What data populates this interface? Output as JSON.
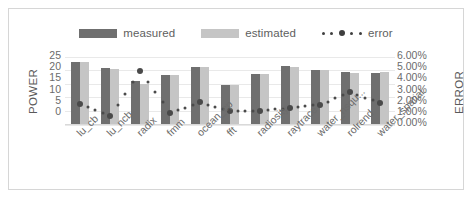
{
  "chart_data": {
    "type": "bar",
    "title": "",
    "subtitle": "",
    "xlabel": "",
    "ylabel": "POWER",
    "y2label": "ERROR",
    "ylim": [
      0,
      25
    ],
    "y2lim": [
      0,
      0.06
    ],
    "grid": true,
    "legend_position": "top-center",
    "categories": [
      "lu_cb",
      "lu_ncb",
      "radix",
      "fmm",
      "ocean_cp",
      "fft",
      "radiosity",
      "raytrace",
      "water_nsqu...",
      "rolrend",
      "water_spatial"
    ],
    "y_ticks": [
      "25",
      "20",
      "15",
      "10",
      "5",
      "0"
    ],
    "y2_ticks": [
      "6.00%",
      "5.00%",
      "4.00%",
      "3.00%",
      "2.00%",
      "1.00%",
      "0.00%"
    ],
    "series": [
      {
        "name": "measured",
        "type": "bar",
        "axis": "left",
        "color": "#6f6f6f",
        "values": [
          23.0,
          20.7,
          16.0,
          18.3,
          21.0,
          14.7,
          18.5,
          21.4,
          20.0,
          19.3,
          19.0
        ]
      },
      {
        "name": "estimated",
        "type": "bar",
        "axis": "left",
        "color": "#c5c5c5",
        "values": [
          23.0,
          20.5,
          15.0,
          18.3,
          21.0,
          14.7,
          18.6,
          21.3,
          20.2,
          18.8,
          19.2
        ]
      },
      {
        "name": "error",
        "type": "line-markers",
        "axis": "right",
        "color": "#4a4a4a",
        "values": [
          0.0185,
          0.0075,
          0.047,
          0.0105,
          0.0195,
          0.0115,
          0.0115,
          0.015,
          0.0175,
          0.0285,
          0.019
        ]
      }
    ]
  },
  "legend": {
    "items": [
      {
        "label": "measured",
        "icon": "bar-swatch-dark",
        "color": "#6f6f6f"
      },
      {
        "label": "estimated",
        "icon": "bar-swatch-light",
        "color": "#c5c5c5"
      },
      {
        "label": "error",
        "icon": "dotted-line-marker",
        "color": "#4a4a4a"
      }
    ]
  }
}
